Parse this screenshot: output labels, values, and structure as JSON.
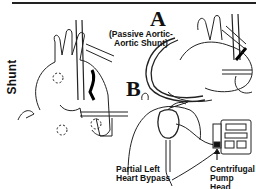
{
  "figure": {
    "side_label": "Shunt",
    "panel_a": {
      "letter": "A",
      "caption_line1": "(Passive Aortic-",
      "caption_line2": "Aortic Shunt)"
    },
    "panel_b": {
      "letter": "B",
      "label_bypass_line1": "Partial Left",
      "label_bypass_line2": "Heart Bypass",
      "label_pump_line1": "Centrifugal",
      "label_pump_line2": "Pump Head"
    }
  }
}
